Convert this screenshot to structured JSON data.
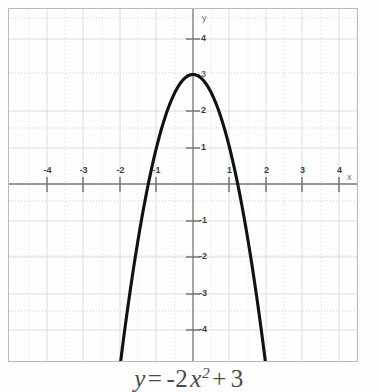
{
  "figure": {
    "caption": {
      "full_text": "y = -2x^2 + 3",
      "lhs": "y",
      "equals": "=",
      "coefficient": "-2",
      "variable": "x",
      "exponent": "2",
      "plus": "+",
      "constant": "3"
    }
  },
  "axis_labels": {
    "x": "x",
    "y": "y"
  },
  "ticks": {
    "x": [
      {
        "value": -4,
        "label": "-4"
      },
      {
        "value": -3,
        "label": "-3"
      },
      {
        "value": -2,
        "label": "-2"
      },
      {
        "value": -1,
        "label": "-1"
      },
      {
        "value": 1,
        "label": "1"
      },
      {
        "value": 2,
        "label": "2"
      },
      {
        "value": 3,
        "label": "3"
      },
      {
        "value": 4,
        "label": "4"
      }
    ],
    "y": [
      {
        "value": 4,
        "label": "4"
      },
      {
        "value": 3,
        "label": "3"
      },
      {
        "value": 2,
        "label": "2"
      },
      {
        "value": 1,
        "label": "1"
      },
      {
        "value": -1,
        "label": "-1"
      },
      {
        "value": -2,
        "label": "-2"
      },
      {
        "value": -3,
        "label": "-3"
      },
      {
        "value": -4,
        "label": "-4"
      }
    ]
  },
  "colors": {
    "curve": "#111111",
    "axis": "#767676",
    "grid_major": "#d8d8d8",
    "grid_minor": "#cfcfcf",
    "frame": "#b9b9b9",
    "tick_label": "#3f3f3f",
    "caption": "#4a4a4a",
    "background": "#fefefe"
  },
  "chart_data": {
    "type": "line",
    "equation": "y = -2x^2 + 3",
    "function": {
      "form": "quadratic",
      "a": -2,
      "b": 0,
      "c": 3,
      "vertex": [
        0,
        3
      ],
      "opens": "down",
      "axis_of_symmetry": 0,
      "roots": [
        -1.2247,
        1.2247
      ],
      "y_intercept": 3
    },
    "xlabel": "x",
    "ylabel": "y",
    "xlim": [
      -5.05,
      4.55
    ],
    "ylim": [
      -4.9,
      4.8
    ],
    "xticks": [
      -4,
      -3,
      -2,
      -1,
      1,
      2,
      3,
      4
    ],
    "yticks": [
      -4,
      -3,
      -2,
      -1,
      1,
      2,
      3,
      4
    ],
    "grid": true,
    "legend": false,
    "series": [
      {
        "name": "y = -2x^2 + 3",
        "x": [
          -1.95,
          -1.8,
          -1.6,
          -1.4,
          -1.2247,
          -1.0,
          -0.8,
          -0.6,
          -0.4,
          -0.2,
          0,
          0.2,
          0.4,
          0.6,
          0.8,
          1.0,
          1.2247,
          1.4,
          1.6,
          1.8,
          1.95
        ],
        "y": [
          -4.605,
          -3.48,
          -2.12,
          -0.92,
          0,
          1,
          1.72,
          2.28,
          2.68,
          2.92,
          3,
          2.92,
          2.68,
          2.28,
          1.72,
          1,
          0,
          -0.92,
          -2.12,
          -3.48,
          -4.605
        ]
      }
    ]
  }
}
